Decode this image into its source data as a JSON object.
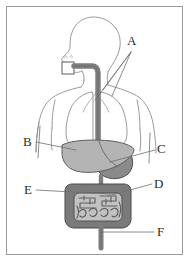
{
  "diagram": {
    "type": "labeled anatomical diagram",
    "frame": {
      "border_color": "#9a9a9a",
      "background_color": "#ffffff"
    },
    "figure": {
      "name": "human-torso-outline",
      "orientation": "front view with head in left profile",
      "outline_color": "#8e8e8e"
    },
    "organs": [
      {
        "name": "mouth-box-marker",
        "label": "mouth",
        "fill": "none",
        "stroke": "#6a6a6a"
      },
      {
        "name": "esophagus",
        "label": "esophagus",
        "fill": "#7d7d7d",
        "stroke": "#5a5a5a"
      },
      {
        "name": "lung-left",
        "label": "lung",
        "fill": "none",
        "stroke": "#8e8e8e"
      },
      {
        "name": "lung-right",
        "label": "lung",
        "fill": "none",
        "stroke": "#8e8e8e"
      },
      {
        "name": "liver",
        "label": "liver",
        "fill": "#b4b4b4",
        "stroke": "#5f5f5f"
      },
      {
        "name": "stomach",
        "label": "stomach",
        "fill": "#8a8a8a",
        "stroke": "#4f4f4f"
      },
      {
        "name": "large-intestine",
        "label": "large intestine",
        "fill": "#7a7a7a",
        "stroke": "#4a4a4a"
      },
      {
        "name": "small-intestine",
        "label": "small intestine",
        "fill": "#b9b9b9",
        "stroke": "#5a5a5a"
      },
      {
        "name": "rectum",
        "label": "rectum",
        "fill": "#7d7d7d",
        "stroke": "#5a5a5a"
      }
    ],
    "labels": [
      {
        "id": "A",
        "text": "A",
        "x": 128,
        "y": 41,
        "leader_count": 3,
        "points_to": "lungs / trachea region"
      },
      {
        "id": "B",
        "text": "B",
        "x": 24,
        "y": 138,
        "leader_count": 1,
        "points_to": "liver"
      },
      {
        "id": "C",
        "text": "C",
        "x": 158,
        "y": 145,
        "leader_count": 1,
        "points_to": "stomach"
      },
      {
        "id": "D",
        "text": "D",
        "x": 155,
        "y": 181,
        "leader_count": 1,
        "points_to": "large intestine"
      },
      {
        "id": "E",
        "text": "E",
        "x": 26,
        "y": 186,
        "leader_count": 1,
        "points_to": "small intestine"
      },
      {
        "id": "F",
        "text": "F",
        "x": 158,
        "y": 228,
        "leader_count": 1,
        "points_to": "rectum"
      }
    ],
    "leader_line_color": "#6e6e6e"
  }
}
